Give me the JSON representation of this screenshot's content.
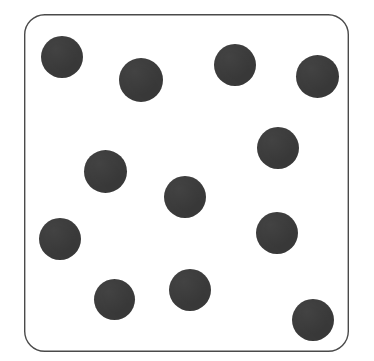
{
  "scene": {
    "width": 374,
    "height": 361,
    "background_color": "#ffffff",
    "description": "Scanned dot-counting card: a white rounded-rectangle panel outlined in thin dark gray containing twelve scattered solid dark-gray filled circles."
  },
  "card": {
    "name": "dot-card",
    "x": 24,
    "y": 14,
    "width": 325,
    "height": 338,
    "corner_radius": 20,
    "fill_color": "#ffffff",
    "border_color": "#4a4a4a",
    "border_width": 1.4
  },
  "dots": {
    "count": 12,
    "fill_color": "#3b3b3b",
    "items": [
      {
        "id": 1,
        "label": "dot-top-left",
        "cx": 62,
        "cy": 57,
        "d": 42
      },
      {
        "id": 2,
        "label": "dot-top-second",
        "cx": 141,
        "cy": 80,
        "d": 44
      },
      {
        "id": 3,
        "label": "dot-top-third",
        "cx": 235,
        "cy": 65,
        "d": 42
      },
      {
        "id": 4,
        "label": "dot-top-right",
        "cx": 317,
        "cy": 76,
        "d": 43
      },
      {
        "id": 5,
        "label": "dot-upper-right",
        "cx": 278,
        "cy": 148,
        "d": 42
      },
      {
        "id": 6,
        "label": "dot-mid-left",
        "cx": 105,
        "cy": 171,
        "d": 43
      },
      {
        "id": 7,
        "label": "dot-center",
        "cx": 185,
        "cy": 197,
        "d": 42
      },
      {
        "id": 8,
        "label": "dot-lower-left",
        "cx": 60,
        "cy": 239,
        "d": 42
      },
      {
        "id": 9,
        "label": "dot-lower-right",
        "cx": 277,
        "cy": 233,
        "d": 42
      },
      {
        "id": 10,
        "label": "dot-bottom-left",
        "cx": 114,
        "cy": 299,
        "d": 41
      },
      {
        "id": 11,
        "label": "dot-bottom-center",
        "cx": 190,
        "cy": 290,
        "d": 42
      },
      {
        "id": 12,
        "label": "dot-bottom-right",
        "cx": 313,
        "cy": 320,
        "d": 42
      }
    ]
  }
}
